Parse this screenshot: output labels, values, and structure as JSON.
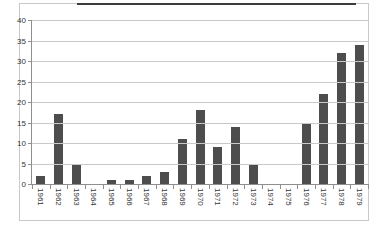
{
  "chart_data": {
    "type": "bar",
    "title": "",
    "xlabel": "",
    "ylabel": "",
    "categories": [
      "1961",
      "1962",
      "1963",
      "1964",
      "1965",
      "1966",
      "1967",
      "1968",
      "1969",
      "1970",
      "1971",
      "1972",
      "1973",
      "1974",
      "1975",
      "1976",
      "1977",
      "1978",
      "1979"
    ],
    "values": [
      2,
      17,
      5,
      0,
      1,
      1,
      2,
      3,
      11,
      18,
      9,
      14,
      5,
      0,
      0,
      15,
      22,
      32,
      34
    ],
    "ylim": [
      0,
      40
    ],
    "ytick_step": 5,
    "ytick_labels": [
      "0",
      "5",
      "10",
      "15",
      "20",
      "25",
      "30",
      "35",
      "40"
    ],
    "grid": true,
    "legend": false,
    "x_labels_rotated": true,
    "colors": {
      "bar": "#4d4d4d",
      "gridline": "#c9c9c9",
      "axis": "#8f8f8f",
      "tick_label": "#333333",
      "frame_border": "#c9c9c9",
      "top_edge_line": "#3c3c3c",
      "background": "#ffffff"
    }
  }
}
